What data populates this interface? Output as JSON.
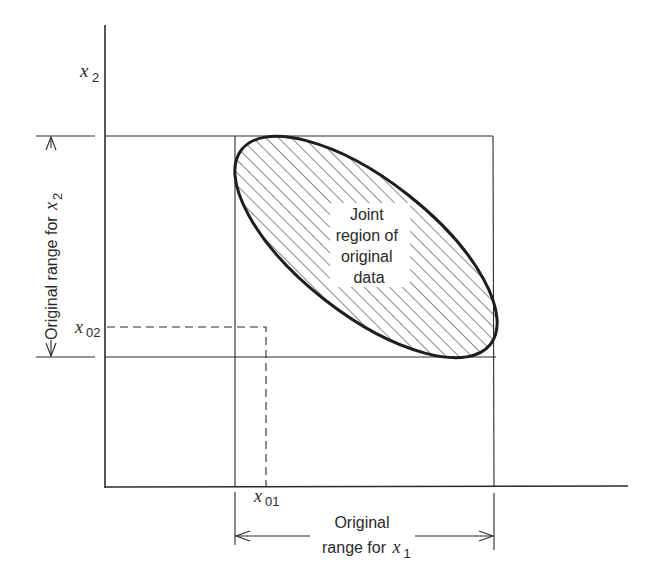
{
  "diagram": {
    "type": "joint-range-illustration",
    "axes": {
      "x_axis_label": "x",
      "x_axis_sub": "1",
      "y_axis_label": "x",
      "y_axis_sub": "2"
    },
    "region": {
      "label_lines": [
        "Joint",
        "region of",
        "original",
        "data"
      ],
      "fill_pattern": "diagonal-hatch",
      "shape": "rotated-ellipse"
    },
    "point_labels": {
      "x01_var": "x",
      "x01_sub": "01",
      "x02_var": "x",
      "x02_sub": "02"
    },
    "range_x1": {
      "line1": "Original",
      "line2_prefix": "range for ",
      "line2_var": "x",
      "line2_sub": "1"
    },
    "range_x2": {
      "text_prefix": "Original range for ",
      "var": "x",
      "sub": "2"
    },
    "colors": {
      "line": "#2a2a2a",
      "background": "#ffffff"
    }
  }
}
